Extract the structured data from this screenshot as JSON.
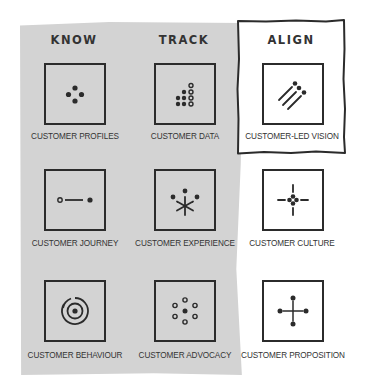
{
  "columns": [
    {
      "title": "KNOW"
    },
    {
      "title": "TRACK"
    },
    {
      "title": "ALIGN"
    }
  ],
  "grid": [
    [
      {
        "label": "CUSTOMER PROFILES",
        "icon": "four-dots-diamond-icon"
      },
      {
        "label": "CUSTOMER DATA",
        "icon": "dot-staircase-icon"
      },
      {
        "label": "CUSTOMER-LED VISION",
        "icon": "diagonal-lines-dots-icon"
      }
    ],
    [
      {
        "label": "CUSTOMER JOURNEY",
        "icon": "dot-line-dot-icon"
      },
      {
        "label": "CUSTOMER EXPERIENCE",
        "icon": "asterisk-dots-icon"
      },
      {
        "label": "CUSTOMER CULTURE",
        "icon": "crosshair-dots-icon"
      }
    ],
    [
      {
        "label": "CUSTOMER BEHAVIOUR",
        "icon": "concentric-circles-icon"
      },
      {
        "label": "CUSTOMER ADVOCACY",
        "icon": "ring-of-dots-icon"
      },
      {
        "label": "CUSTOMER PROPOSITION",
        "icon": "cross-dots-icon"
      }
    ]
  ],
  "colors": {
    "highlight_region": "#d3d3d3",
    "stroke": "#2b2b2b",
    "background": "#ffffff"
  }
}
